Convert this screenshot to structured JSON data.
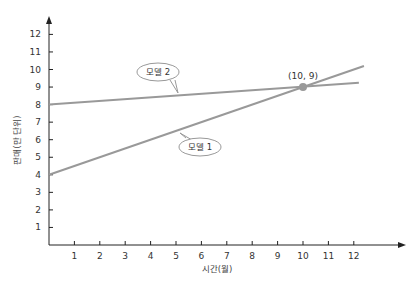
{
  "chart_data": {
    "type": "line",
    "title": "",
    "xlabel": "시간(월)",
    "ylabel": "판매(만 단위)",
    "x_ticks": [
      1,
      2,
      3,
      4,
      5,
      6,
      7,
      8,
      9,
      10,
      11,
      12
    ],
    "y_ticks": [
      1,
      2,
      3,
      4,
      5,
      6,
      7,
      8,
      9,
      10,
      11,
      12
    ],
    "xlim": [
      0,
      13
    ],
    "ylim": [
      0,
      12.5
    ],
    "grid": false,
    "series": [
      {
        "name": "모델 1",
        "x": [
          0,
          12.4
        ],
        "y": [
          4,
          10.2
        ],
        "color": "#999999"
      },
      {
        "name": "모델 2",
        "x": [
          0,
          12.2
        ],
        "y": [
          8,
          9.24
        ],
        "color": "#999999"
      }
    ],
    "annotations": [
      {
        "text": "(10, 9)",
        "x": 10,
        "y": 9,
        "type": "point"
      },
      {
        "text": "모델 2",
        "type": "callout",
        "series": "모델 2"
      },
      {
        "text": "모델 1",
        "type": "callout",
        "series": "모델 1"
      }
    ]
  }
}
